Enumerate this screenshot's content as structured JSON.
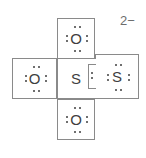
{
  "figure": {
    "kind": "lewis-structure",
    "overall_charge": "2−",
    "layout": "cross",
    "background_color": "#ffffff",
    "line_color": "#8a8a8a",
    "text_color": "#3f3f3f",
    "charge_color": "#6d6d6d"
  },
  "slots": {
    "top": {
      "symbol": "O",
      "name": "oxygen",
      "lone_pairs": 4,
      "dots": 8,
      "pair_positions": [
        "top",
        "bottom",
        "left",
        "right"
      ]
    },
    "left": {
      "symbol": "O",
      "name": "oxygen",
      "lone_pairs": 4,
      "dots": 8,
      "pair_positions": [
        "top",
        "bottom",
        "left",
        "right"
      ]
    },
    "center": {
      "symbol": "S",
      "name": "sulfur",
      "lone_pairs": 0,
      "dots": 0,
      "pair_positions": []
    },
    "right": {
      "symbol": "S",
      "name": "sulfur",
      "lone_pairs": 4,
      "dots": 8,
      "pair_positions": [
        "top",
        "bottom",
        "left",
        "right"
      ]
    },
    "bottom": {
      "symbol": "O",
      "name": "oxygen",
      "lone_pairs": 4,
      "dots": 8,
      "pair_positions": [
        "top",
        "bottom",
        "left",
        "right"
      ]
    }
  },
  "charge": {
    "text": "2−"
  }
}
